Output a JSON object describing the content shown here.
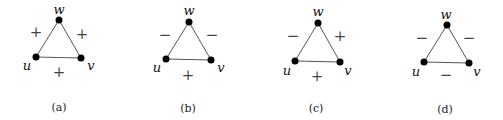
{
  "figure": {
    "panels": [
      {
        "caption": "(a)",
        "vertices": {
          "w": "w",
          "u": "u",
          "v": "v"
        },
        "edges": {
          "uw": "+",
          "wv": "+",
          "uv": "+"
        }
      },
      {
        "caption": "(b)",
        "vertices": {
          "w": "w",
          "u": "u",
          "v": "v"
        },
        "edges": {
          "uw": "−",
          "wv": "−",
          "uv": "+"
        }
      },
      {
        "caption": "(c)",
        "vertices": {
          "w": "w",
          "u": "u",
          "v": "v"
        },
        "edges": {
          "uw": "−",
          "wv": "+",
          "uv": "+"
        }
      },
      {
        "caption": "(d)",
        "vertices": {
          "w": "w",
          "u": "u",
          "v": "v"
        },
        "edges": {
          "uw": "−",
          "wv": "−",
          "uv": "−"
        }
      }
    ]
  }
}
